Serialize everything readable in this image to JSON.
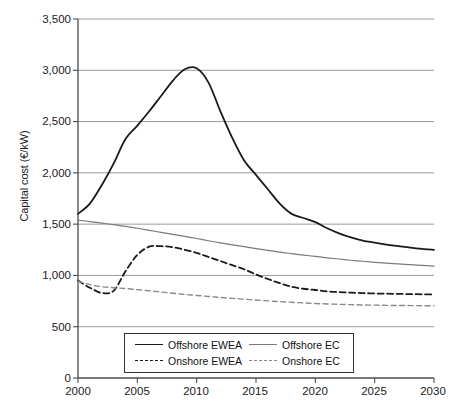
{
  "chart_data": {
    "type": "line",
    "title": "",
    "xlabel": "",
    "ylabel": "Capital cost (€/kW)",
    "xlim": [
      2000,
      2030
    ],
    "ylim": [
      0,
      3500
    ],
    "grid": true,
    "legend_position": "bottom-center",
    "x_ticks": [
      "2000",
      "2005",
      "2010",
      "2015",
      "2020",
      "2025",
      "2030"
    ],
    "y_ticks": [
      "0",
      "500",
      "1,000",
      "1,500",
      "2,000",
      "2,500",
      "3,000",
      "3,500"
    ],
    "x": [
      2000,
      2001,
      2002,
      2003,
      2004,
      2005,
      2006,
      2007,
      2008,
      2009,
      2010,
      2011,
      2012,
      2013,
      2014,
      2015,
      2016,
      2017,
      2018,
      2019,
      2020,
      2021,
      2022,
      2023,
      2024,
      2025,
      2026,
      2027,
      2028,
      2029,
      2030
    ],
    "series": [
      {
        "name": "Offshore EWEA",
        "color": "#1a1a1a",
        "style": "solid",
        "width": 1.8,
        "values": [
          1600,
          1700,
          1880,
          2090,
          2330,
          2460,
          2600,
          2750,
          2900,
          3010,
          3020,
          2880,
          2600,
          2340,
          2120,
          1980,
          1840,
          1700,
          1600,
          1560,
          1520,
          1460,
          1410,
          1370,
          1340,
          1320,
          1300,
          1285,
          1270,
          1258,
          1250
        ]
      },
      {
        "name": "Offshore EC",
        "color": "#7a7a7a",
        "style": "solid",
        "width": 1.2,
        "values": [
          1540,
          1525,
          1510,
          1495,
          1478,
          1460,
          1440,
          1420,
          1400,
          1380,
          1360,
          1338,
          1318,
          1298,
          1280,
          1262,
          1244,
          1228,
          1212,
          1198,
          1186,
          1172,
          1160,
          1148,
          1138,
          1128,
          1120,
          1112,
          1105,
          1098,
          1090
        ]
      },
      {
        "name": "Onshore EWEA",
        "color": "#1a1a1a",
        "style": "dashed",
        "width": 1.8,
        "values": [
          950,
          880,
          830,
          850,
          1040,
          1200,
          1280,
          1285,
          1275,
          1250,
          1220,
          1180,
          1140,
          1100,
          1060,
          1010,
          965,
          925,
          890,
          870,
          858,
          845,
          838,
          832,
          828,
          824,
          822,
          820,
          818,
          816,
          815
        ]
      },
      {
        "name": "Onshore EC",
        "color": "#8a8a8a",
        "style": "dashed",
        "width": 1.4,
        "values": [
          945,
          910,
          890,
          880,
          872,
          862,
          850,
          838,
          826,
          815,
          805,
          795,
          785,
          776,
          768,
          760,
          752,
          745,
          738,
          732,
          726,
          722,
          718,
          715,
          712,
          710,
          708,
          707,
          706,
          705,
          705
        ]
      }
    ],
    "legend": [
      {
        "label": "Offshore EWEA",
        "color": "#1a1a1a",
        "style": "solid"
      },
      {
        "label": "Offshore EC",
        "color": "#7a7a7a",
        "style": "solid"
      },
      {
        "label": "Onshore EWEA",
        "color": "#1a1a1a",
        "style": "dashed"
      },
      {
        "label": "Onshore EC",
        "color": "#8a8a8a",
        "style": "dashed"
      }
    ]
  },
  "axis": {
    "y_title": "Capital cost (€/kW)"
  }
}
